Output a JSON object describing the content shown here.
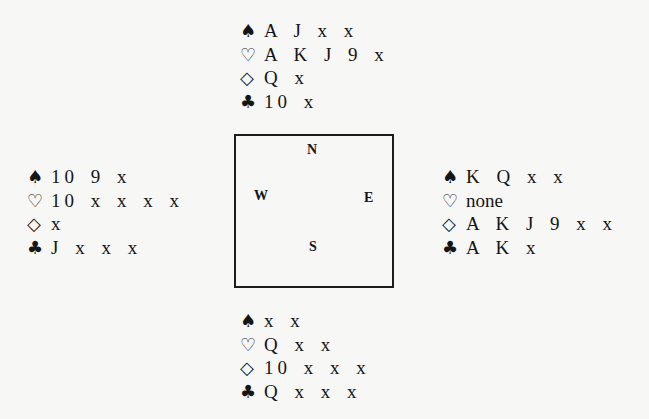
{
  "diagram": {
    "type": "bridge-deal",
    "table": {
      "seats": {
        "north": "N",
        "west": "W",
        "east": "E",
        "south": "S"
      }
    },
    "suit_symbols": {
      "spades": "♠",
      "hearts": "♡",
      "diamonds": "◇",
      "clubs": "♣"
    },
    "hands": {
      "north": {
        "spades": "A J x x",
        "hearts": "A K J 9 x",
        "diamonds": "Q x",
        "clubs": "10 x"
      },
      "west": {
        "spades": "10 9 x",
        "hearts": "10 x x x x",
        "diamonds": "x",
        "clubs": "J x x x"
      },
      "east": {
        "spades": "K Q x x",
        "hearts": "none",
        "diamonds": "A K J 9 x x",
        "clubs": "A K x"
      },
      "south": {
        "spades": "x x",
        "hearts": "Q x x",
        "diamonds": "10 x x x",
        "clubs": "Q x x x"
      }
    }
  }
}
